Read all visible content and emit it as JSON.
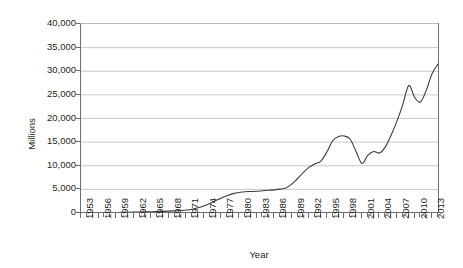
{
  "chart_data": {
    "type": "line",
    "title": "",
    "xlabel": "Year",
    "ylabel": "Millions",
    "xlim": [
      1953,
      2014
    ],
    "ylim": [
      0,
      40000
    ],
    "grid": true,
    "legend": false,
    "y_ticks": [
      0,
      5000,
      10000,
      15000,
      20000,
      25000,
      30000,
      35000,
      40000
    ],
    "y_tick_labels": [
      "0",
      "5,000",
      "10,000",
      "15,000",
      "20,000",
      "25,000",
      "30,000",
      "35,000",
      "40,000"
    ],
    "x_tick_labels": [
      "1953",
      "1956",
      "1959",
      "1962",
      "1965",
      "1968",
      "1971",
      "1974",
      "1977",
      "1980",
      "1983",
      "1986",
      "1989",
      "1992",
      "1995",
      "1998",
      "2001",
      "2004",
      "2007",
      "2010",
      "2013"
    ],
    "x_tick_label_step": 3,
    "x_minor_tick_step": 1,
    "series": [
      {
        "name": "Value",
        "color": "#3b3b3b",
        "x": [
          1953,
          1954,
          1955,
          1956,
          1957,
          1958,
          1959,
          1960,
          1961,
          1962,
          1963,
          1964,
          1965,
          1966,
          1967,
          1968,
          1969,
          1970,
          1971,
          1972,
          1973,
          1974,
          1975,
          1976,
          1977,
          1978,
          1979,
          1980,
          1981,
          1982,
          1983,
          1984,
          1985,
          1986,
          1987,
          1988,
          1989,
          1990,
          1991,
          1992,
          1993,
          1994,
          1995,
          1996,
          1997,
          1998,
          1999,
          2000,
          2001,
          2002,
          2003,
          2004,
          2005,
          2006,
          2007,
          2008,
          2009,
          2010,
          2011,
          2012,
          2013,
          2014
        ],
        "values": [
          60,
          70,
          80,
          90,
          100,
          110,
          120,
          140,
          160,
          180,
          200,
          230,
          260,
          300,
          340,
          390,
          450,
          520,
          620,
          800,
          1100,
          1500,
          2000,
          2600,
          3200,
          3700,
          4100,
          4350,
          4500,
          4550,
          4600,
          4700,
          4800,
          4900,
          5050,
          5300,
          6100,
          7300,
          8600,
          9700,
          10400,
          11000,
          12900,
          15300,
          16200,
          16300,
          15600,
          13000,
          10500,
          12200,
          13000,
          12700,
          14000,
          16500,
          19500,
          23000,
          27000,
          24500,
          23500,
          26000,
          29500,
          31500
        ]
      }
    ],
    "series_extra_points": {
      "peak_1998_label": "16,300",
      "trough_2001_label": "10,500",
      "peak_2009_label": "27,000",
      "final_peak_label": "37,000"
    }
  }
}
